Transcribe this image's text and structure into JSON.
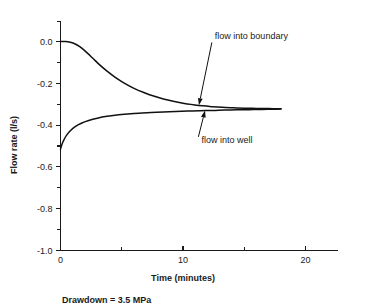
{
  "chart_data": {
    "type": "line",
    "title": "",
    "xlabel": "Time (minutes)",
    "ylabel": "Flow rate (l/s)",
    "xlim": [
      0,
      23.5
    ],
    "ylim": [
      -1.0,
      0.1
    ],
    "grid": false,
    "legend_position": "inline-annotations",
    "xticks": [
      0,
      5,
      10,
      15,
      20
    ],
    "xtick_labels": [
      "0",
      "",
      "10",
      "",
      "20"
    ],
    "yticks": [
      0.0,
      -0.1,
      -0.2,
      -0.3,
      -0.4,
      -0.5,
      -0.6,
      -0.7,
      -0.8,
      -0.9,
      -1.0
    ],
    "ytick_labels": [
      "0.0",
      "",
      "-0.2",
      "",
      "-0.4",
      "",
      "-0.6",
      "",
      "-0.8",
      "",
      "-1.0"
    ],
    "caption": "Drawdown = 3.5 MPa",
    "annotations": [
      {
        "text": "flow into boundary",
        "x_text": 12.6,
        "y_text": 0.01,
        "x_point": 11.3,
        "y_point": -0.305
      },
      {
        "text": "flow into well",
        "x_text": 11.5,
        "y_text": -0.485,
        "x_point": 11.8,
        "y_point": -0.33
      }
    ],
    "series": [
      {
        "name": "flow into boundary",
        "x": [
          0.0,
          0.4,
          0.8,
          1.2,
          1.6,
          2.0,
          2.6,
          3.2,
          3.8,
          4.5,
          5.2,
          6.0,
          6.8,
          7.6,
          8.4,
          9.2,
          10.0,
          10.8,
          11.6,
          12.4,
          13.2,
          14.0,
          15.0,
          16.0,
          17.0,
          18.0
        ],
        "y": [
          0.0,
          0.0,
          -0.004,
          -0.012,
          -0.026,
          -0.045,
          -0.078,
          -0.112,
          -0.142,
          -0.173,
          -0.199,
          -0.224,
          -0.244,
          -0.261,
          -0.275,
          -0.286,
          -0.295,
          -0.302,
          -0.308,
          -0.312,
          -0.315,
          -0.317,
          -0.319,
          -0.32,
          -0.321,
          -0.322
        ]
      },
      {
        "name": "flow into well",
        "x": [
          0.0,
          0.15,
          0.3,
          0.5,
          0.8,
          1.2,
          1.7,
          2.3,
          3.0,
          3.8,
          4.6,
          5.5,
          6.4,
          7.4,
          8.4,
          9.4,
          10.4,
          11.4,
          12.4,
          13.4,
          14.4,
          15.4,
          16.4,
          17.2,
          18.0
        ],
        "y": [
          -0.515,
          -0.487,
          -0.468,
          -0.448,
          -0.427,
          -0.407,
          -0.391,
          -0.378,
          -0.367,
          -0.358,
          -0.352,
          -0.347,
          -0.343,
          -0.34,
          -0.337,
          -0.335,
          -0.333,
          -0.331,
          -0.33,
          -0.328,
          -0.327,
          -0.326,
          -0.325,
          -0.324,
          -0.323
        ]
      }
    ]
  }
}
